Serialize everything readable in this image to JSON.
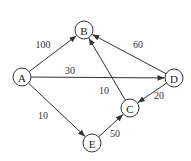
{
  "diagram": {
    "type": "directed-weighted-graph",
    "nodes": [
      {
        "id": "A",
        "label": "A",
        "x": 22,
        "y": 77
      },
      {
        "id": "B",
        "label": "B",
        "x": 84,
        "y": 30
      },
      {
        "id": "C",
        "label": "C",
        "x": 130,
        "y": 108
      },
      {
        "id": "D",
        "label": "D",
        "x": 174,
        "y": 78
      },
      {
        "id": "E",
        "label": "E",
        "x": 92,
        "y": 143
      }
    ],
    "edges": [
      {
        "from": "A",
        "to": "B",
        "weight": "100",
        "lx": 43,
        "ly": 44
      },
      {
        "from": "A",
        "to": "D",
        "weight": "30",
        "lx": 70,
        "ly": 70
      },
      {
        "from": "A",
        "to": "E",
        "weight": "10",
        "lx": 43,
        "ly": 115
      },
      {
        "from": "D",
        "to": "B",
        "weight": "60",
        "lx": 138,
        "ly": 44
      },
      {
        "from": "C",
        "to": "B",
        "weight": "10",
        "lx": 104,
        "ly": 90
      },
      {
        "from": "D",
        "to": "C",
        "weight": "20",
        "lx": 159,
        "ly": 95
      },
      {
        "from": "E",
        "to": "C",
        "weight": "50",
        "lx": 115,
        "ly": 133
      }
    ]
  }
}
